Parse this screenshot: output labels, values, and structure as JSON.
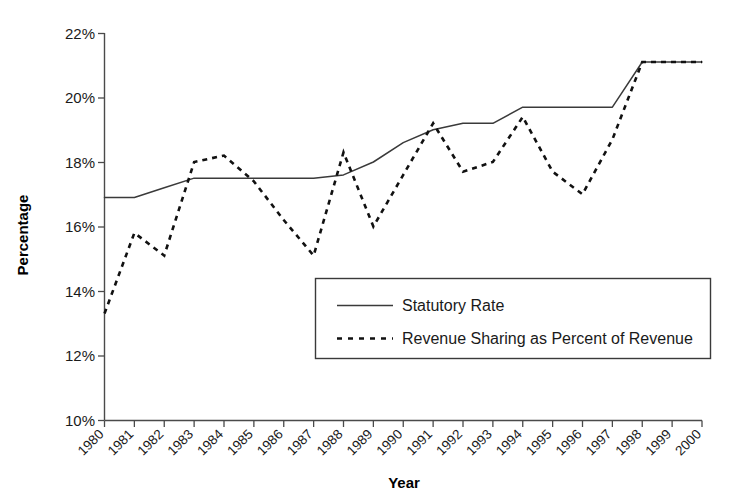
{
  "chart_data": {
    "type": "line",
    "title": "",
    "xlabel": "Year",
    "ylabel": "Percentage",
    "xlim": [
      1980,
      2000
    ],
    "ylim": [
      10,
      22
    ],
    "ytick_labels": [
      "22%",
      "20%",
      "18%",
      "16%",
      "14%",
      "12%",
      "10%"
    ],
    "ytick_values": [
      22,
      20,
      18,
      16,
      14,
      12,
      10
    ],
    "grid": false,
    "legend_position": "center",
    "categories": [
      1980,
      1981,
      1982,
      1983,
      1984,
      1985,
      1986,
      1987,
      1988,
      1989,
      1990,
      1991,
      1992,
      1993,
      1994,
      1995,
      1996,
      1997,
      1998,
      1999,
      2000
    ],
    "x_tick_labels": [
      "1980",
      "1981",
      "1982",
      "1983",
      "1984",
      "1985",
      "1986",
      "1987",
      "1988",
      "1989",
      "1990",
      "1991",
      "1992",
      "1993",
      "1994",
      "1995",
      "1996",
      "1997",
      "1998",
      "1999",
      "2000"
    ],
    "series": [
      {
        "name": "Statutory Rate",
        "style": "solid",
        "color": "#3a3a3a",
        "values": [
          16.9,
          16.9,
          17.2,
          17.5,
          17.5,
          17.5,
          17.5,
          17.5,
          17.6,
          18.0,
          18.6,
          19.0,
          19.2,
          19.2,
          19.7,
          19.7,
          19.7,
          19.7,
          21.1,
          21.1,
          21.1
        ]
      },
      {
        "name": "Revenue Sharing as Percent of Revenue",
        "style": "dashed",
        "color": "#111111",
        "values": [
          13.3,
          15.8,
          15.1,
          18.0,
          18.2,
          17.4,
          16.2,
          15.1,
          18.3,
          16.0,
          17.6,
          19.2,
          17.7,
          18.0,
          19.4,
          17.7,
          17.0,
          18.7,
          21.1,
          21.1,
          21.1
        ]
      }
    ]
  },
  "legend": {
    "entries": [
      {
        "label": "Statutory Rate",
        "style": "solid"
      },
      {
        "label": "Revenue Sharing as Percent of Revenue",
        "style": "dashed"
      }
    ]
  },
  "axes": {
    "y_title": "Percentage",
    "x_title": "Year"
  }
}
